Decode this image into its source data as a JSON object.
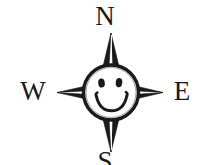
{
  "figure": {
    "name": "compass-rose-with-smiley-face",
    "background_color": "#ffffff",
    "ink_color": "#1a1a1a"
  },
  "cardinal_points": {
    "north": "N",
    "west": "W",
    "east": "E",
    "south": "S"
  },
  "icons": {
    "compass_star": "compass-star-icon",
    "smiley_face": "smiley-face-icon",
    "eye_left": "eye-icon",
    "eye_right": "eye-icon",
    "smile": "smile-icon"
  }
}
